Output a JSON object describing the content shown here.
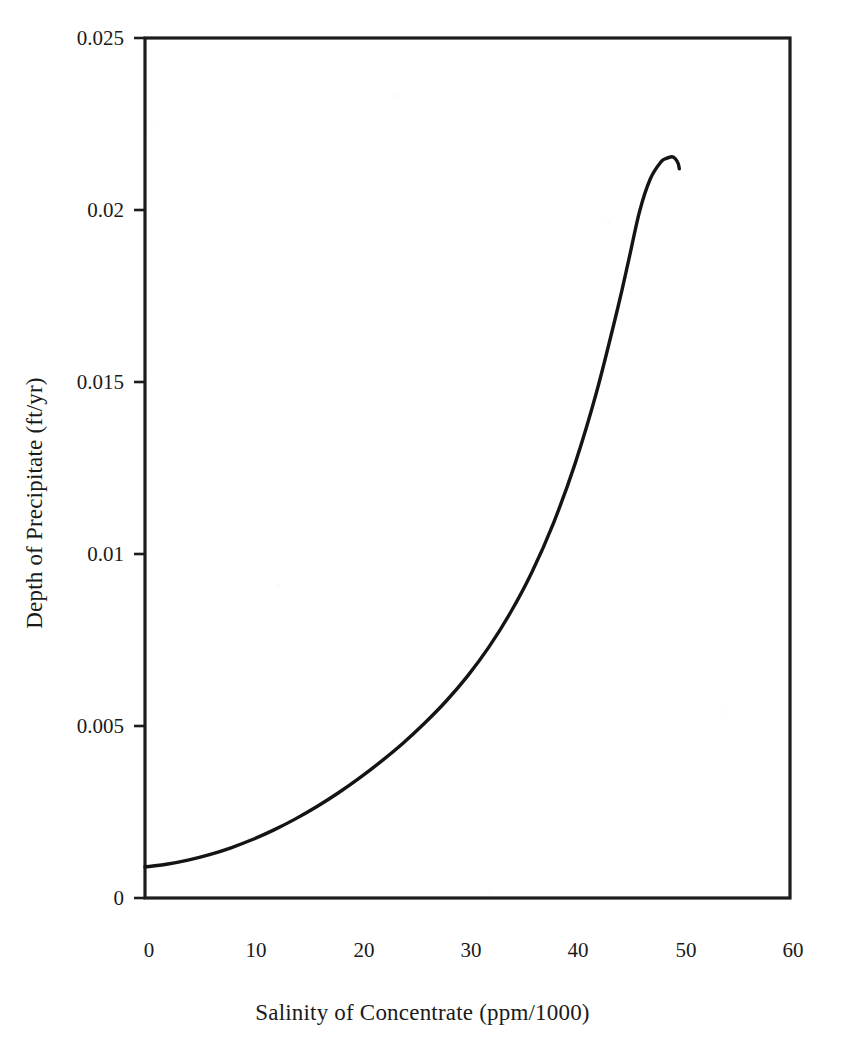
{
  "figure": {
    "background_color": "#ffffff",
    "ink_color": "#141414",
    "style": "scanned-book-line-figure"
  },
  "axes": {
    "x_title": "Salinity of Concentrate (ppm/1000)",
    "y_title": "Depth of Precipitate (ft/yr)",
    "x_ticks": [
      "0",
      "10",
      "20",
      "30",
      "40",
      "50",
      "60"
    ],
    "y_ticks": [
      "0",
      "0.005",
      "0.01",
      "0.015",
      "0.02",
      "0.025"
    ]
  },
  "chart_data": {
    "type": "line",
    "title": "",
    "subtitle": "",
    "xlabel": "Salinity of Concentrate (ppm/1000)",
    "ylabel": "Depth of Precipitate (ft/yr)",
    "xlim": [
      0,
      60
    ],
    "ylim": [
      0,
      0.025
    ],
    "xticks": [
      0,
      10,
      20,
      30,
      40,
      50,
      60
    ],
    "yticks": [
      0,
      0.005,
      0.01,
      0.015,
      0.02,
      0.025
    ],
    "grid": false,
    "legend": null,
    "legend_position": "none",
    "annotations": [],
    "series": [
      {
        "name": "Depth of Precipitate",
        "color": "#141414",
        "line_width": 3.4,
        "x": [
          0,
          2,
          4,
          6,
          8,
          10,
          12,
          14,
          16,
          18,
          20,
          22,
          24,
          26,
          28,
          30,
          32,
          34,
          36,
          38,
          40,
          42,
          44,
          45,
          46,
          47,
          48,
          48.5,
          49,
          49.3,
          49.6,
          49.7
        ],
        "y": [
          0.0009,
          0.00098,
          0.0011,
          0.00126,
          0.00146,
          0.0017,
          0.00198,
          0.0023,
          0.00266,
          0.00306,
          0.0035,
          0.00398,
          0.0045,
          0.00508,
          0.00572,
          0.00645,
          0.0073,
          0.0083,
          0.00948,
          0.0109,
          0.01262,
          0.0147,
          0.01718,
          0.01855,
          0.01995,
          0.0209,
          0.0214,
          0.0215,
          0.02155,
          0.0215,
          0.02135,
          0.0212
        ]
      }
    ]
  }
}
